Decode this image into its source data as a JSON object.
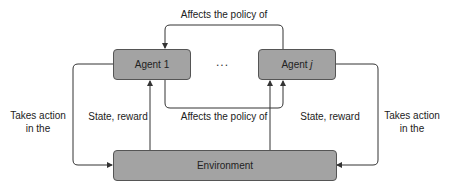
{
  "diagram": {
    "nodes": {
      "agent1": {
        "label": "Agent 1"
      },
      "agentj": {
        "label_prefix": "Agent",
        "label_var": "j"
      },
      "environment": {
        "label": "Environment"
      },
      "ellipsis": "..."
    },
    "edges": {
      "top_policy": "Affects the policy of",
      "bottom_policy": "Affects the policy of",
      "left_action_line1": "Takes action",
      "left_action_line2": "in the",
      "right_action_line1": "Takes action",
      "right_action_line2": "in the",
      "left_state": "State, reward",
      "right_state": "State, reward"
    },
    "colors": {
      "box_fill": "#a3a3a3",
      "box_border": "#555555",
      "line": "#333333",
      "text": "#222222"
    }
  }
}
